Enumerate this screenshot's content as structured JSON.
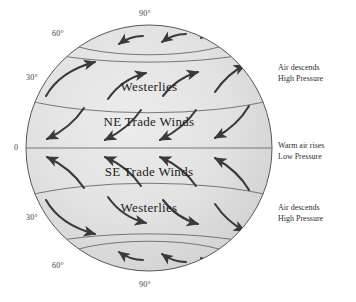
{
  "diagram": {
    "globe": {
      "center_x": 149,
      "center_y": 148,
      "radius": 123,
      "fill_color": "#dedede",
      "edge_color": "#555555"
    },
    "latitude_labels": [
      {
        "name": "north-pole-90",
        "text": "90°",
        "x": 149,
        "y": 14
      },
      {
        "name": "north-60",
        "text": "60°",
        "x": 62,
        "y": 34
      },
      {
        "name": "north-30",
        "text": "30°",
        "x": 36,
        "y": 78
      },
      {
        "name": "equator-0",
        "text": "0",
        "x": 19,
        "y": 148
      },
      {
        "name": "south-30",
        "text": "30°",
        "x": 36,
        "y": 218
      },
      {
        "name": "south-60",
        "text": "60°",
        "x": 62,
        "y": 266
      },
      {
        "name": "south-pole-90",
        "text": "90°",
        "x": 149,
        "y": 285
      }
    ],
    "wind_bands": [
      {
        "name": "polar-easterlies-north",
        "label": "",
        "center_y": 40,
        "arrow_direction": "left",
        "arrow_count": 4
      },
      {
        "name": "westerlies-north",
        "label": "Westerlies",
        "center_y": 87,
        "arrow_direction": "up-right",
        "arrow_count": 4
      },
      {
        "name": "ne-trade-winds",
        "label": "NE Trade Winds",
        "center_y": 122,
        "arrow_direction": "down-left",
        "arrow_count": 4
      },
      {
        "name": "se-trade-winds",
        "label": "SE Trade Winds",
        "center_y": 172,
        "arrow_direction": "up-left",
        "arrow_count": 4
      },
      {
        "name": "westerlies-south",
        "label": "Westerlies",
        "center_y": 208,
        "arrow_direction": "down-right",
        "arrow_count": 4
      },
      {
        "name": "polar-easterlies-south",
        "label": "",
        "center_y": 255,
        "arrow_direction": "left",
        "arrow_count": 4
      }
    ],
    "annotations": [
      {
        "name": "north-high-pressure-note",
        "line1": "Air descends",
        "line2": "High Pressure",
        "x": 278,
        "y": 68
      },
      {
        "name": "equator-low-pressure-note",
        "line1": "Warm air rises",
        "line2": "Low Pressure",
        "x": 278,
        "y": 141
      },
      {
        "name": "south-high-pressure-note",
        "line1": "Air descends",
        "line2": "High Pressure",
        "x": 278,
        "y": 208
      }
    ],
    "colors": {
      "globe_fill": "#dedede",
      "globe_fill_light": "#e8e8e8",
      "arrow": "#3a3a3a",
      "line": "#6a6a6a",
      "text": "#222222"
    }
  }
}
